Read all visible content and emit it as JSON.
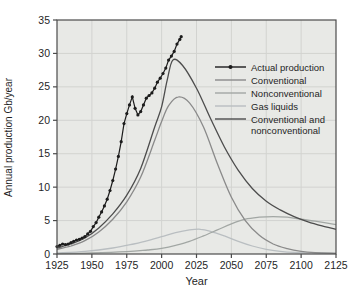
{
  "chart_data": {
    "type": "line",
    "title": "",
    "xlabel": "Year",
    "ylabel": "Annual production Gb/year",
    "xlim": [
      1925,
      2125
    ],
    "ylim": [
      0,
      35
    ],
    "x_ticks": [
      1925,
      1950,
      1975,
      2000,
      2025,
      2050,
      2075,
      2100,
      2125
    ],
    "y_ticks": [
      0,
      5,
      10,
      15,
      20,
      25,
      30,
      35
    ],
    "grid": true,
    "legend_position": "inside-right",
    "colors": {
      "plot_bg": "#e8e9e6",
      "grid": "#d2d3d0",
      "axis": "#4b4b4b",
      "text": "#1f1f1f"
    },
    "series": [
      {
        "name": "Actual production",
        "color": "#1c1c1c",
        "marker": "circle",
        "smooth": false,
        "legend_lines": [
          "Actual production"
        ],
        "points": [
          [
            1925,
            1.1
          ],
          [
            1927,
            1.3
          ],
          [
            1929,
            1.5
          ],
          [
            1931,
            1.4
          ],
          [
            1933,
            1.5
          ],
          [
            1935,
            1.7
          ],
          [
            1937,
            1.9
          ],
          [
            1939,
            2.1
          ],
          [
            1941,
            2.2
          ],
          [
            1943,
            2.4
          ],
          [
            1945,
            2.6
          ],
          [
            1947,
            3.0
          ],
          [
            1949,
            3.4
          ],
          [
            1951,
            4.1
          ],
          [
            1953,
            4.7
          ],
          [
            1955,
            5.5
          ],
          [
            1957,
            6.3
          ],
          [
            1959,
            7.2
          ],
          [
            1961,
            8.2
          ],
          [
            1963,
            9.5
          ],
          [
            1965,
            11.0
          ],
          [
            1967,
            12.7
          ],
          [
            1969,
            14.6
          ],
          [
            1971,
            16.8
          ],
          [
            1973,
            19.5
          ],
          [
            1975,
            21.0
          ],
          [
            1977,
            22.3
          ],
          [
            1979,
            23.5
          ],
          [
            1981,
            21.8
          ],
          [
            1983,
            20.8
          ],
          [
            1985,
            21.3
          ],
          [
            1987,
            22.3
          ],
          [
            1989,
            23.3
          ],
          [
            1991,
            23.7
          ],
          [
            1993,
            24.1
          ],
          [
            1995,
            24.8
          ],
          [
            1997,
            25.7
          ],
          [
            1999,
            26.3
          ],
          [
            2001,
            27.0
          ],
          [
            2003,
            27.8
          ],
          [
            2005,
            29.0
          ],
          [
            2007,
            29.6
          ],
          [
            2009,
            30.3
          ],
          [
            2011,
            31.4
          ],
          [
            2013,
            32.1
          ],
          [
            2014,
            32.5
          ]
        ]
      },
      {
        "name": "Conventional",
        "color": "#8a8a8a",
        "marker": "none",
        "smooth": true,
        "legend_lines": [
          "Conventional"
        ],
        "points": [
          [
            1925,
            0.7
          ],
          [
            1935,
            1.2
          ],
          [
            1945,
            2.0
          ],
          [
            1955,
            3.3
          ],
          [
            1965,
            5.2
          ],
          [
            1975,
            7.8
          ],
          [
            1985,
            11.5
          ],
          [
            1995,
            17.0
          ],
          [
            2000,
            19.8
          ],
          [
            2005,
            22.2
          ],
          [
            2012,
            23.5
          ],
          [
            2020,
            22.6
          ],
          [
            2030,
            19.0
          ],
          [
            2040,
            13.5
          ],
          [
            2050,
            8.5
          ],
          [
            2060,
            5.0
          ],
          [
            2070,
            2.8
          ],
          [
            2080,
            1.5
          ],
          [
            2090,
            0.8
          ],
          [
            2100,
            0.4
          ],
          [
            2110,
            0.2
          ],
          [
            2125,
            0.1
          ]
        ]
      },
      {
        "name": "Nonconventional",
        "color": "#a2a7a4",
        "marker": "none",
        "smooth": true,
        "legend_lines": [
          "Nonconventional"
        ],
        "points": [
          [
            1925,
            0.05
          ],
          [
            1950,
            0.15
          ],
          [
            1975,
            0.35
          ],
          [
            1990,
            0.6
          ],
          [
            2000,
            0.85
          ],
          [
            2010,
            1.3
          ],
          [
            2020,
            1.9
          ],
          [
            2030,
            2.7
          ],
          [
            2040,
            3.6
          ],
          [
            2050,
            4.5
          ],
          [
            2060,
            5.2
          ],
          [
            2070,
            5.5
          ],
          [
            2080,
            5.6
          ],
          [
            2090,
            5.5
          ],
          [
            2100,
            5.2
          ],
          [
            2110,
            4.9
          ],
          [
            2125,
            4.4
          ]
        ]
      },
      {
        "name": "Gas liquids",
        "color": "#b9bec1",
        "marker": "none",
        "smooth": true,
        "legend_lines": [
          "Gas liquids"
        ],
        "points": [
          [
            1925,
            0.15
          ],
          [
            1945,
            0.4
          ],
          [
            1965,
            0.9
          ],
          [
            1980,
            1.5
          ],
          [
            1990,
            2.0
          ],
          [
            2000,
            2.6
          ],
          [
            2010,
            3.2
          ],
          [
            2020,
            3.6
          ],
          [
            2028,
            3.7
          ],
          [
            2035,
            3.4
          ],
          [
            2045,
            2.7
          ],
          [
            2055,
            1.9
          ],
          [
            2065,
            1.2
          ],
          [
            2075,
            0.7
          ],
          [
            2085,
            0.4
          ],
          [
            2095,
            0.25
          ],
          [
            2110,
            0.15
          ],
          [
            2125,
            0.1
          ]
        ]
      },
      {
        "name": "Conventional and nonconventional",
        "color": "#4d4d4d",
        "marker": "none",
        "smooth": true,
        "legend_lines": [
          "Conventional and",
          "nonconventional"
        ],
        "points": [
          [
            1925,
            0.9
          ],
          [
            1935,
            1.5
          ],
          [
            1945,
            2.4
          ],
          [
            1955,
            3.9
          ],
          [
            1965,
            6.0
          ],
          [
            1975,
            8.8
          ],
          [
            1985,
            12.8
          ],
          [
            1995,
            19.0
          ],
          [
            2000,
            22.0
          ],
          [
            2004,
            26.0
          ],
          [
            2008,
            29.0
          ],
          [
            2015,
            28.2
          ],
          [
            2025,
            24.8
          ],
          [
            2035,
            20.3
          ],
          [
            2045,
            16.0
          ],
          [
            2055,
            12.5
          ],
          [
            2065,
            9.8
          ],
          [
            2075,
            7.9
          ],
          [
            2085,
            6.6
          ],
          [
            2095,
            5.6
          ],
          [
            2105,
            4.8
          ],
          [
            2115,
            4.2
          ],
          [
            2125,
            3.7
          ]
        ]
      }
    ],
    "draw_order": [
      "Gas liquids",
      "Nonconventional",
      "Conventional",
      "Conventional and nonconventional",
      "Actual production"
    ]
  }
}
